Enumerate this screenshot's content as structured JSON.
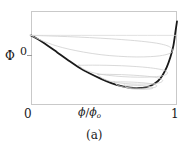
{
  "figure": {
    "caption": "(a)",
    "y_axis": {
      "label": "Φ",
      "ticks": [
        "0"
      ]
    },
    "x_axis": {
      "label_numerator": "ϕ",
      "label_slash": "/",
      "label_denominator": "ϕ",
      "label_subscript": "o",
      "ticks": [
        "0",
        "1"
      ]
    },
    "colors": {
      "main_curve": "#1a1a1a",
      "loop_curves": "#cfcfcf",
      "frame": "#c9c9c9",
      "background": "#ffffff",
      "text": "#1a1a1a"
    }
  },
  "chart_data": {
    "type": "line",
    "title": "",
    "xlabel": "ϕ/ϕₒ",
    "ylabel": "Φ",
    "xlim": [
      0,
      1
    ],
    "ylim": [
      -1.0,
      0.35
    ],
    "grid": false,
    "legend": null,
    "annotations": [
      "(a)"
    ],
    "xticks": [
      0,
      1
    ],
    "xticklabels": [
      "0",
      "1"
    ],
    "yticks": [
      0
    ],
    "yticklabels": [
      "0"
    ],
    "series": [
      {
        "name": "free-energy-envelope",
        "style": "solid-thick",
        "color": "#1a1a1a",
        "x": [
          0.0,
          0.03,
          0.07,
          0.12,
          0.18,
          0.25,
          0.32,
          0.4,
          0.48,
          0.55,
          0.62,
          0.68,
          0.74,
          0.79,
          0.83,
          0.87,
          0.9,
          0.93,
          0.955,
          0.975,
          0.99,
          1.0
        ],
        "y": [
          0.0,
          -0.035,
          -0.085,
          -0.155,
          -0.245,
          -0.35,
          -0.45,
          -0.545,
          -0.625,
          -0.685,
          -0.73,
          -0.752,
          -0.756,
          -0.742,
          -0.712,
          -0.655,
          -0.575,
          -0.455,
          -0.31,
          -0.15,
          0.06,
          0.2
        ]
      },
      {
        "name": "loop-curve-1",
        "style": "solid-thin",
        "color": "#cfcfcf",
        "x": [
          0.0,
          0.12,
          0.25,
          0.4,
          0.55,
          0.68,
          0.78,
          0.86,
          0.92,
          0.955,
          0.97,
          0.955,
          0.9,
          0.82,
          0.72,
          0.6,
          0.48,
          0.36,
          0.26,
          0.18,
          0.12,
          0.07,
          0.03,
          0.0
        ],
        "y": [
          0.0,
          -0.008,
          -0.018,
          -0.032,
          -0.05,
          -0.07,
          -0.09,
          -0.112,
          -0.14,
          -0.172,
          -0.215,
          -0.255,
          -0.288,
          -0.305,
          -0.31,
          -0.3,
          -0.278,
          -0.24,
          -0.198,
          -0.155,
          -0.112,
          -0.07,
          -0.032,
          0.0
        ]
      },
      {
        "name": "loop-curve-2",
        "style": "solid-thin",
        "color": "#cfcfcf",
        "x": [
          0.33,
          0.42,
          0.52,
          0.62,
          0.72,
          0.8,
          0.87,
          0.915,
          0.935,
          0.915,
          0.86,
          0.78,
          0.68,
          0.58,
          0.48,
          0.4,
          0.35,
          0.33
        ],
        "y": [
          -0.43,
          -0.428,
          -0.43,
          -0.436,
          -0.448,
          -0.462,
          -0.482,
          -0.505,
          -0.54,
          -0.572,
          -0.592,
          -0.6,
          -0.598,
          -0.585,
          -0.56,
          -0.52,
          -0.472,
          -0.43
        ]
      },
      {
        "name": "loop-curve-3",
        "style": "solid-thin",
        "color": "#cfcfcf",
        "x": [
          0.46,
          0.54,
          0.62,
          0.7,
          0.78,
          0.845,
          0.885,
          0.902,
          0.885,
          0.84,
          0.77,
          0.69,
          0.61,
          0.54,
          0.485,
          0.46
        ],
        "y": [
          -0.56,
          -0.56,
          -0.564,
          -0.572,
          -0.584,
          -0.6,
          -0.622,
          -0.65,
          -0.678,
          -0.694,
          -0.7,
          -0.698,
          -0.684,
          -0.658,
          -0.612,
          -0.56
        ]
      },
      {
        "name": "loop-curve-4",
        "style": "solid-thin",
        "color": "#cfcfcf",
        "x": [
          0.57,
          0.63,
          0.7,
          0.76,
          0.81,
          0.848,
          0.862,
          0.848,
          0.81,
          0.755,
          0.695,
          0.635,
          0.59,
          0.57
        ],
        "y": [
          -0.668,
          -0.668,
          -0.672,
          -0.68,
          -0.69,
          -0.706,
          -0.726,
          -0.746,
          -0.757,
          -0.76,
          -0.756,
          -0.742,
          -0.712,
          -0.668
        ]
      },
      {
        "name": "loop-curve-5",
        "style": "solid-thin",
        "color": "#cfcfcf",
        "x": [
          0.64,
          0.7,
          0.755,
          0.8,
          0.828,
          0.836,
          0.822,
          0.785,
          0.735,
          0.685,
          0.655,
          0.64
        ],
        "y": [
          -0.716,
          -0.716,
          -0.722,
          -0.73,
          -0.742,
          -0.756,
          -0.768,
          -0.774,
          -0.774,
          -0.766,
          -0.746,
          -0.716
        ]
      },
      {
        "name": "baseline-top",
        "style": "solid-thin",
        "color": "#d9d9d9",
        "x": [
          0.0,
          1.0
        ],
        "y": [
          0.0,
          0.0
        ]
      }
    ]
  }
}
